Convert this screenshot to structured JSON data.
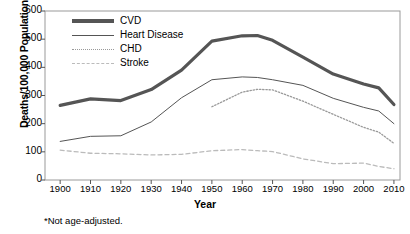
{
  "chart_data": {
    "type": "line",
    "title": "",
    "xlabel": "Year",
    "ylabel": "Deaths/100,000 Population",
    "footnote": "*Not age-adjusted.",
    "xlim": [
      1895,
      2012
    ],
    "ylim": [
      0,
      600
    ],
    "ytick_step": 100,
    "grid": false,
    "legend_position": "top-left",
    "x_ticks": [
      1900,
      1910,
      1920,
      1930,
      1940,
      1950,
      1960,
      1970,
      1980,
      1990,
      2000,
      2010
    ],
    "y_ticks": [
      0,
      100,
      200,
      300,
      400,
      500,
      600
    ],
    "series": [
      {
        "name": "CVD",
        "style": "thick-solid",
        "color": "#555555",
        "x": [
          1900,
          1910,
          1920,
          1930,
          1940,
          1950,
          1960,
          1965,
          1970,
          1980,
          1990,
          2000,
          2005,
          2010
        ],
        "values": [
          265,
          288,
          282,
          321,
          390,
          493,
          512,
          513,
          496,
          436,
          376,
          341,
          327,
          268
        ]
      },
      {
        "name": "Heart Disease",
        "style": "thin-solid",
        "color": "#555555",
        "x": [
          1900,
          1910,
          1920,
          1930,
          1940,
          1950,
          1960,
          1965,
          1970,
          1980,
          1990,
          2000,
          2005,
          2010
        ],
        "values": [
          137,
          155,
          157,
          206,
          292,
          356,
          366,
          364,
          356,
          336,
          290,
          258,
          245,
          200
        ]
      },
      {
        "name": "CHD",
        "style": "dotted",
        "color": "#999999",
        "x": [
          1950,
          1960,
          1965,
          1970,
          1980,
          1990,
          2000,
          2005,
          2010
        ],
        "values": [
          260,
          312,
          322,
          320,
          280,
          233,
          187,
          170,
          130
        ]
      },
      {
        "name": "Stroke",
        "style": "dashed",
        "color": "#bbbbbb",
        "x": [
          1900,
          1910,
          1920,
          1930,
          1940,
          1950,
          1960,
          1965,
          1970,
          1980,
          1990,
          2000,
          2005,
          2010
        ],
        "values": [
          106,
          95,
          93,
          89,
          91,
          104,
          108,
          104,
          101,
          75,
          58,
          60,
          48,
          40
        ]
      }
    ]
  },
  "legend": {
    "items": [
      {
        "label": "CVD"
      },
      {
        "label": "Heart Disease"
      },
      {
        "label": "CHD"
      },
      {
        "label": "Stroke"
      }
    ]
  }
}
